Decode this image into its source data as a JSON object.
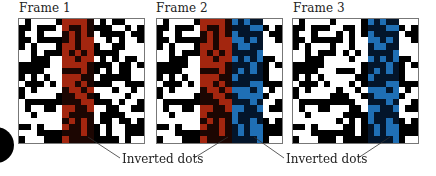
{
  "figure": {
    "frames": [
      {
        "title": "Frame 1",
        "left": 18,
        "stripes": [
          {
            "color": "red",
            "col_start": 7,
            "col_end": 11
          }
        ]
      },
      {
        "title": "Frame 2",
        "left": 156,
        "stripes": [
          {
            "color": "red",
            "col_start": 7,
            "col_end": 11
          },
          {
            "color": "blue",
            "col_start": 12,
            "col_end": 16
          }
        ]
      },
      {
        "title": "Frame 3",
        "left": 292,
        "stripes": [
          {
            "color": "blue",
            "col_start": 12,
            "col_end": 16
          }
        ]
      }
    ],
    "grid": {
      "cols": 20,
      "rows": 20
    },
    "labels": [
      {
        "text": "Inverted dots",
        "left": 120
      },
      {
        "text": "Inverted dots",
        "left": 284
      }
    ],
    "colors": {
      "dot_dark": "#000000",
      "dot_light": "#ffffff",
      "red_light": "#a3260f",
      "red_dark": "#1c0602",
      "blue_light": "#1f6fb5",
      "blue_dark": "#03152b",
      "border": "#777777"
    }
  }
}
